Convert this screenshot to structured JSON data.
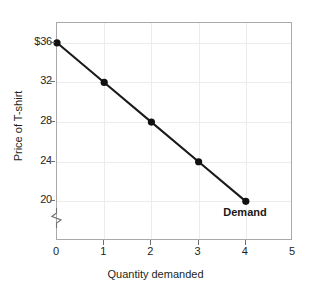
{
  "chart_data": {
    "type": "line",
    "title": "",
    "subtitle": "",
    "xlabel": "Quantity demanded",
    "ylabel": "Price of T-shirt",
    "x": [
      0,
      1,
      2,
      3,
      4
    ],
    "values": [
      36,
      32,
      28,
      24,
      20
    ],
    "series": [
      {
        "name": "Demand",
        "x": [
          0,
          1,
          2,
          3,
          4
        ],
        "values": [
          36,
          32,
          28,
          24,
          20
        ]
      }
    ],
    "xlim": [
      0,
      5
    ],
    "ylim": [
      16,
      38
    ],
    "xticks": [
      "0",
      "1",
      "2",
      "3",
      "4",
      "5"
    ],
    "xtick_values": [
      0,
      1,
      2,
      3,
      4,
      5
    ],
    "yticks": [
      "$36",
      "32",
      "28",
      "24",
      "20"
    ],
    "ytick_values": [
      36,
      32,
      28,
      24,
      20
    ],
    "grid": true,
    "legend": "none",
    "annotations": [
      {
        "text": "Demand",
        "x": 4,
        "y": 20,
        "style": "bold",
        "placement": "below-right-of-last-point"
      }
    ],
    "axis_break": {
      "axis": "y",
      "symbol": "zigzag",
      "below_value": 20
    },
    "colors": {
      "line": "#1a1a1a",
      "marker": "#111111",
      "grid": "#ececed",
      "axis": "#a9a9ab",
      "text": "#231f20",
      "background": "#ffffff"
    }
  }
}
